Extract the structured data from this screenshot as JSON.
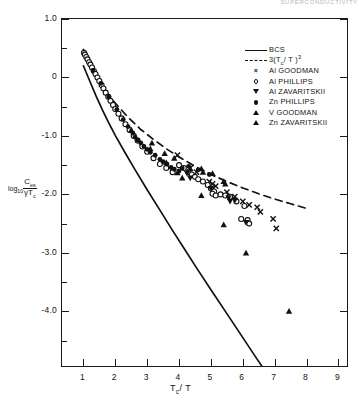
{
  "running_head": "SUPERCONDUCTIVITY",
  "axes": {
    "x": {
      "title_main": "T",
      "title_sub": "c",
      "title_tail": "/ T",
      "title_plain": "Tc / T",
      "ticks": [
        "1",
        "2",
        "3",
        "4",
        "5",
        "6",
        "7",
        "8",
        "9"
      ],
      "tick_values": [
        1,
        2,
        3,
        4,
        5,
        6,
        7,
        8,
        9
      ],
      "range": [
        0.33,
        9.33
      ]
    },
    "y": {
      "title_log": "log",
      "title_log_sub": "10",
      "title_num": "C",
      "title_num_sub": "es",
      "title_den_g": "γ",
      "title_den_t": "T",
      "title_den_sub": "c",
      "title_plain": "log10 Ces / γTc",
      "ticks": [
        "1.0",
        "0",
        "-1.0",
        "-2.0",
        "-3.0",
        "-4.0"
      ],
      "tick_values": [
        1.0,
        0,
        -1.0,
        -2.0,
        -3.0,
        -4.0
      ],
      "minor_tick_values": [
        0.5,
        -0.5,
        -1.5,
        -2.5,
        -3.5,
        -4.5
      ],
      "range": [
        -4.97,
        1.0
      ]
    }
  },
  "legend": {
    "position": "top-right",
    "entries": [
      {
        "key": "solid-line",
        "label": "BCS",
        "label_pre": "BCS",
        "sub": "",
        "tail": "",
        "sup": ""
      },
      {
        "key": "dashed-line",
        "label": "3(Tc/T)3",
        "label_pre": "3(T",
        "sub": "c",
        "tail": "/ T )",
        "sup": "3"
      },
      {
        "key": "marker-x",
        "label": "Al  GOODMAN",
        "label_pre": "Al  GOODMAN",
        "sub": "",
        "tail": "",
        "sup": ""
      },
      {
        "key": "marker-circle",
        "label": "Al  PHILLIPS",
        "label_pre": "Al  PHILLIPS",
        "sub": "",
        "tail": "",
        "sup": ""
      },
      {
        "key": "marker-tri-down",
        "label": "Al  ZAVARITSKII",
        "label_pre": "Al  ZAVARITSKII",
        "sub": "",
        "tail": "",
        "sup": ""
      },
      {
        "key": "marker-dot",
        "label": "Zn PHILLIPS",
        "label_pre": "Zn PHILLIPS",
        "sub": "",
        "tail": "",
        "sup": ""
      },
      {
        "key": "marker-tri-up",
        "label": "V  GOODMAN",
        "label_pre": "V  GOODMAN",
        "sub": "",
        "tail": "",
        "sup": ""
      },
      {
        "key": "marker-tri-up2",
        "label": "Zn ZAVARITSKII",
        "label_pre": "Zn ZAVARITSKII",
        "sub": "",
        "tail": "",
        "sup": ""
      }
    ]
  },
  "colors": {
    "ink": "#111111",
    "paper": "#ffffff",
    "faint": "#b8b8b8"
  },
  "chart_data": {
    "type": "scatter",
    "title": "",
    "xlabel": "Tc / T",
    "ylabel": "log10 ( Ces / γ Tc )",
    "xlim": [
      0.33,
      9.33
    ],
    "ylim": [
      -4.97,
      1.0
    ],
    "grid": false,
    "legend_position": "top-right",
    "curves": [
      {
        "name": "BCS",
        "style": "solid",
        "color": "#111111",
        "points": [
          [
            1.0,
            0.2
          ],
          [
            1.2,
            -0.06
          ],
          [
            1.4,
            -0.32
          ],
          [
            1.6,
            -0.56
          ],
          [
            1.8,
            -0.78
          ],
          [
            2.0,
            -0.99
          ],
          [
            2.3,
            -1.28
          ],
          [
            2.6,
            -1.56
          ],
          [
            3.0,
            -1.92
          ],
          [
            3.4,
            -2.27
          ],
          [
            3.8,
            -2.62
          ],
          [
            4.2,
            -2.96
          ],
          [
            4.6,
            -3.3
          ],
          [
            5.0,
            -3.63
          ],
          [
            5.5,
            -4.04
          ],
          [
            6.0,
            -4.45
          ],
          [
            6.4,
            -4.78
          ],
          [
            6.8,
            -5.1
          ]
        ]
      },
      {
        "name": "3(Tc/T)^3",
        "style": "dashed",
        "color": "#111111",
        "points": [
          [
            1.0,
            0.48
          ],
          [
            1.2,
            0.24
          ],
          [
            1.4,
            0.04
          ],
          [
            1.6,
            -0.14
          ],
          [
            1.8,
            -0.3
          ],
          [
            2.0,
            -0.44
          ],
          [
            2.4,
            -0.68
          ],
          [
            2.8,
            -0.89
          ],
          [
            3.2,
            -1.06
          ],
          [
            3.6,
            -1.22
          ],
          [
            4.0,
            -1.36
          ],
          [
            4.5,
            -1.52
          ],
          [
            5.0,
            -1.66
          ],
          [
            5.5,
            -1.78
          ],
          [
            6.0,
            -1.89
          ],
          [
            6.5,
            -1.99
          ],
          [
            7.0,
            -2.08
          ],
          [
            7.5,
            -2.16
          ],
          [
            8.0,
            -2.24
          ]
        ]
      }
    ],
    "series": [
      {
        "name": "Al GOODMAN",
        "marker": "x",
        "filled": true,
        "points": [
          [
            3.95,
            -1.33
          ],
          [
            4.35,
            -1.55
          ],
          [
            4.55,
            -1.62
          ],
          [
            4.95,
            -1.78
          ],
          [
            5.05,
            -1.82
          ],
          [
            5.15,
            -1.86
          ],
          [
            5.5,
            -1.96
          ],
          [
            5.75,
            -2.04
          ],
          [
            6.0,
            -2.12
          ],
          [
            6.2,
            -2.18
          ],
          [
            6.45,
            -2.22
          ],
          [
            6.55,
            -2.3
          ],
          [
            6.95,
            -2.42
          ],
          [
            7.05,
            -2.58
          ]
        ]
      },
      {
        "name": "Al PHILLIPS",
        "marker": "circle",
        "filled": false,
        "points": [
          [
            1.02,
            0.42
          ],
          [
            1.05,
            0.39
          ],
          [
            1.09,
            0.35
          ],
          [
            1.13,
            0.31
          ],
          [
            1.18,
            0.26
          ],
          [
            1.22,
            0.22
          ],
          [
            1.27,
            0.17
          ],
          [
            1.33,
            0.11
          ],
          [
            1.38,
            0.06
          ],
          [
            1.44,
            0.0
          ],
          [
            1.5,
            -0.06
          ],
          [
            1.57,
            -0.13
          ],
          [
            1.63,
            -0.19
          ],
          [
            1.7,
            -0.26
          ],
          [
            1.78,
            -0.33
          ],
          [
            1.85,
            -0.4
          ],
          [
            1.93,
            -0.47
          ],
          [
            2.0,
            -0.54
          ],
          [
            2.1,
            -0.62
          ],
          [
            2.2,
            -0.7
          ],
          [
            2.32,
            -0.8
          ],
          [
            2.45,
            -0.9
          ],
          [
            2.58,
            -1.0
          ],
          [
            2.7,
            -1.08
          ],
          [
            2.85,
            -1.18
          ],
          [
            3.0,
            -1.27
          ],
          [
            3.2,
            -1.38
          ],
          [
            3.4,
            -1.48
          ],
          [
            3.6,
            -1.55
          ],
          [
            3.8,
            -1.62
          ],
          [
            4.0,
            -1.5
          ],
          [
            4.15,
            -1.55
          ],
          [
            4.3,
            -1.62
          ],
          [
            4.4,
            -1.66
          ],
          [
            4.5,
            -1.7
          ],
          [
            4.6,
            -1.74
          ],
          [
            4.75,
            -1.78
          ],
          [
            4.9,
            -1.84
          ],
          [
            5.0,
            -1.9
          ],
          [
            5.1,
            -1.95
          ],
          [
            5.05,
            -1.99
          ],
          [
            5.15,
            -2.02
          ],
          [
            5.3,
            -2.0
          ],
          [
            5.45,
            -2.02
          ],
          [
            5.6,
            -2.04
          ],
          [
            5.8,
            -2.12
          ],
          [
            6.05,
            -2.2
          ],
          [
            6.15,
            -2.44
          ],
          [
            6.2,
            -2.5
          ],
          [
            5.95,
            -2.42
          ]
        ]
      },
      {
        "name": "Al ZAVARITSKII",
        "marker": "triangle-down",
        "filled": true,
        "points": [
          [
            4.25,
            -1.64
          ],
          [
            4.35,
            -1.72
          ],
          [
            5.0,
            -1.9
          ],
          [
            5.55,
            -2.06
          ],
          [
            5.6,
            -2.12
          ],
          [
            5.75,
            -2.1
          ],
          [
            6.1,
            -2.48
          ]
        ]
      },
      {
        "name": "Zn PHILLIPS",
        "marker": "dot",
        "filled": true,
        "points": [
          [
            1.3,
            0.12
          ],
          [
            1.55,
            -0.1
          ],
          [
            1.8,
            -0.33
          ],
          [
            2.05,
            -0.55
          ],
          [
            2.25,
            -0.72
          ],
          [
            2.4,
            -0.84
          ],
          [
            2.55,
            -0.95
          ],
          [
            2.62,
            -1.02
          ],
          [
            2.7,
            -1.07
          ],
          [
            2.8,
            -1.12
          ],
          [
            2.9,
            -1.18
          ],
          [
            3.0,
            -1.23
          ],
          [
            3.1,
            -1.28
          ],
          [
            3.25,
            -1.33
          ],
          [
            3.4,
            -1.4
          ],
          [
            3.5,
            -1.44
          ],
          [
            3.62,
            -1.48
          ],
          [
            3.75,
            -1.54
          ],
          [
            3.85,
            -1.57
          ],
          [
            4.0,
            -1.6
          ],
          [
            4.1,
            -1.55
          ],
          [
            4.3,
            -1.52
          ],
          [
            4.6,
            -1.58
          ],
          [
            4.95,
            -1.66
          ]
        ]
      },
      {
        "name": "V GOODMAN",
        "marker": "triangle-up",
        "filled": true,
        "points": [
          [
            2.5,
            -0.9
          ],
          [
            3.1,
            -1.22
          ],
          [
            3.6,
            -1.46
          ],
          [
            3.95,
            -1.63
          ],
          [
            4.1,
            -1.72
          ]
        ]
      },
      {
        "name": "Zn ZAVARITSKII",
        "marker": "triangle-up",
        "filled": true,
        "points": [
          [
            3.15,
            -1.12
          ],
          [
            3.55,
            -1.3
          ],
          [
            3.85,
            -1.38
          ],
          [
            4.35,
            -1.56
          ],
          [
            4.7,
            -1.56
          ],
          [
            4.75,
            -1.62
          ],
          [
            5.05,
            -1.64
          ],
          [
            5.4,
            -1.78
          ],
          [
            5.45,
            -1.82
          ],
          [
            4.7,
            -2.02
          ],
          [
            5.4,
            -2.52
          ],
          [
            6.1,
            -3.0
          ],
          [
            7.45,
            -4.0
          ]
        ]
      }
    ]
  }
}
